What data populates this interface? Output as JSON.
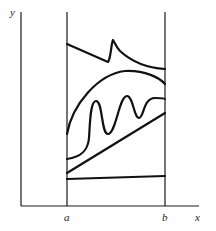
{
  "diagram": {
    "axes": {
      "x_label": "x",
      "y_label": "y"
    },
    "bounds": {
      "left_label": "a",
      "right_label": "b"
    },
    "curves": [
      {
        "name": "top-spiked-curve"
      },
      {
        "name": "arch-curve"
      },
      {
        "name": "oscillating-curve"
      },
      {
        "name": "straight-diagonal-line"
      },
      {
        "name": "bottom-flat-line"
      }
    ],
    "colors": {
      "line": "#111111",
      "background": "#ffffff"
    }
  }
}
